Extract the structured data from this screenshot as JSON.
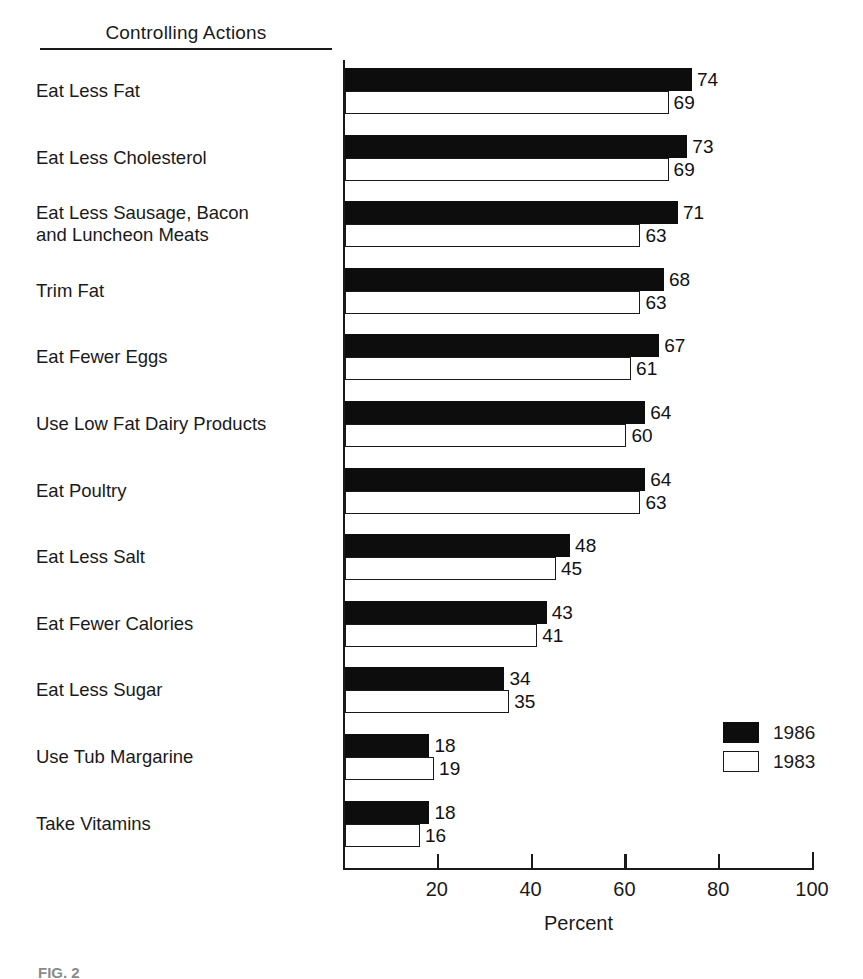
{
  "header": {
    "title": "Controlling Actions"
  },
  "legend": {
    "position": "bottom-right",
    "entries": [
      {
        "label": "1986",
        "swatch": "filled-black-square"
      },
      {
        "label": "1983",
        "swatch": "hollow-white-square"
      }
    ]
  },
  "axis": {
    "x_title": "Percent",
    "ticks": [
      20,
      40,
      60,
      80,
      100
    ],
    "tick_labels": [
      "20",
      "40",
      "60",
      "80",
      "100"
    ]
  },
  "caption": "FIG. 2",
  "chart_data": {
    "type": "bar",
    "orientation": "horizontal",
    "title": "Controlling Actions",
    "xlabel": "Percent",
    "ylabel": "Controlling Actions",
    "xlim": [
      0,
      100
    ],
    "grid": false,
    "legend_position": "bottom-right",
    "categories": [
      "Eat Less Fat",
      "Eat Less Cholesterol",
      "Eat Less Sausage, Bacon and Luncheon Meats",
      "Trim Fat",
      "Eat Fewer Eggs",
      "Use Low Fat Dairy Products",
      "Eat Poultry",
      "Eat Less Salt",
      "Eat Fewer Calories",
      "Eat Less Sugar",
      "Use Tub Margarine",
      "Take Vitamins"
    ],
    "category_lines": [
      [
        "Eat Less Fat"
      ],
      [
        "Eat Less Cholesterol"
      ],
      [
        "Eat Less Sausage, Bacon",
        "and Luncheon Meats"
      ],
      [
        "Trim Fat"
      ],
      [
        "Eat Fewer Eggs"
      ],
      [
        "Use Low Fat Dairy Products"
      ],
      [
        "Eat Poultry"
      ],
      [
        "Eat Less Salt"
      ],
      [
        "Eat Fewer Calories"
      ],
      [
        "Eat Less Sugar"
      ],
      [
        "Use Tub Margarine"
      ],
      [
        "Take Vitamins"
      ]
    ],
    "series": [
      {
        "name": "1986",
        "color": "#0d0d0d",
        "values": [
          74,
          73,
          71,
          68,
          67,
          64,
          64,
          48,
          43,
          34,
          18,
          18
        ]
      },
      {
        "name": "1983",
        "color": "#ffffff",
        "values": [
          69,
          69,
          63,
          63,
          61,
          60,
          63,
          45,
          41,
          35,
          19,
          16
        ]
      }
    ]
  }
}
